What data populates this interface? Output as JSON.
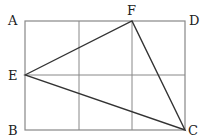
{
  "diagram": {
    "title": "",
    "labels": {
      "A": "A",
      "B": "B",
      "C": "C",
      "D": "D",
      "E": "E",
      "F": "F"
    },
    "points": {
      "A": [
        25,
        21
      ],
      "D": [
        185,
        21
      ],
      "B": [
        25,
        130
      ],
      "C": [
        185,
        130
      ],
      "E": [
        25,
        75
      ],
      "F": [
        132,
        21
      ]
    },
    "grid": {
      "columns": 3,
      "rows": 2,
      "vertical_lines_x": [
        79,
        132
      ],
      "horizontal_lines_y": [
        75
      ]
    },
    "triangle": [
      "E",
      "F",
      "C"
    ],
    "colors": {
      "grid": "#888888",
      "triangle": "#333333",
      "label": "#222222"
    }
  }
}
